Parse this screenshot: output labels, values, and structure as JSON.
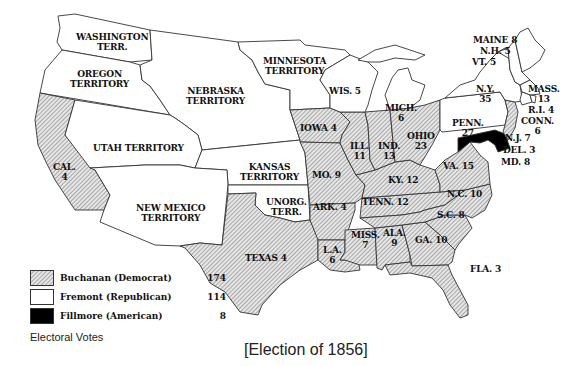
{
  "title": "[Election of 1856]",
  "legend": {
    "heading": "Electoral Votes",
    "items": [
      {
        "label": "Buchanan (Democrat)",
        "votes": "174",
        "fill": "hatched",
        "color": "#c8c8c8"
      },
      {
        "label": "Fremont (Republican)",
        "votes": "114",
        "fill": "white",
        "color": "#ffffff"
      },
      {
        "label": "Fillmore (American)",
        "votes": "8",
        "fill": "black",
        "color": "#000000"
      }
    ]
  },
  "regions": {
    "washington": {
      "line1": "WASHINGTON",
      "line2": "TERR."
    },
    "oregon": {
      "line1": "OREGON",
      "line2": "TERRITORY"
    },
    "nebraska": {
      "line1": "NEBRASKA",
      "line2": "TERRITORY"
    },
    "minnesota": {
      "line1": "MINNESOTA",
      "line2": "TERRITORY"
    },
    "utah": {
      "line1": "UTAH TERRITORY"
    },
    "kansas": {
      "line1": "KANSAS",
      "line2": "TERRITORY"
    },
    "new_mexico": {
      "line1": "NEW MEXICO",
      "line2": "TERRITORY"
    },
    "unorg": {
      "line1": "UNORG.",
      "line2": "TERR."
    },
    "california": {
      "line1": "CAL.",
      "line2": "4"
    },
    "texas": {
      "line1": "TEXAS 4"
    },
    "wisconsin": {
      "line1": "WIS. 5"
    },
    "michigan": {
      "line1": "MICH.",
      "line2": "6"
    },
    "iowa": {
      "line1": "IOWA 4"
    },
    "illinois": {
      "line1": "ILL.",
      "line2": "11"
    },
    "indiana": {
      "line1": "IND.",
      "line2": "13"
    },
    "ohio": {
      "line1": "OHIO",
      "line2": "23"
    },
    "missouri": {
      "line1": "MO. 9"
    },
    "kentucky": {
      "line1": "KY. 12"
    },
    "virginia": {
      "line1": "VA. 15"
    },
    "arkansas": {
      "line1": "ARK. 4"
    },
    "tennessee": {
      "line1": "TENN. 12"
    },
    "north_carolina": {
      "line1": "N.C. 10"
    },
    "south_carolina": {
      "line1": "S.C. 8"
    },
    "louisiana": {
      "line1": "L.A.",
      "line2": "6"
    },
    "mississippi": {
      "line1": "MISS.",
      "line2": "7"
    },
    "alabama": {
      "line1": "ALA.",
      "line2": "9"
    },
    "georgia": {
      "line1": "GA. 10"
    },
    "florida": {
      "line1": "FLA. 3"
    },
    "maine": {
      "line1": "MAINE 8"
    },
    "new_hampshire": {
      "line1": "N.H. 5"
    },
    "vermont": {
      "line1": "VT. 5"
    },
    "new_york": {
      "line1": "N.Y.",
      "line2": "35"
    },
    "massachusetts": {
      "line1": "MASS.",
      "line2": "13"
    },
    "rhode_island": {
      "line1": "R.I. 4"
    },
    "connecticut": {
      "line1": "CONN.",
      "line2": "6"
    },
    "pennsylvania": {
      "line1": "PENN.",
      "line2": "27"
    },
    "new_jersey": {
      "line1": "N.J. 7"
    },
    "delaware": {
      "line1": "DEL. 3"
    },
    "maryland": {
      "line1": "MD. 8"
    }
  }
}
